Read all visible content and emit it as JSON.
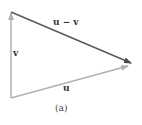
{
  "figure": {
    "caption": "(a)",
    "vectors": [
      {
        "name": "v",
        "label": "v",
        "from": [
          11,
          98
        ],
        "to": [
          11,
          12
        ],
        "color": "#b0b0b0"
      },
      {
        "name": "u",
        "label": "u",
        "from": [
          11,
          98
        ],
        "to": [
          128,
          66
        ],
        "color": "#b0b0b0"
      },
      {
        "name": "u-minus-v",
        "label": "u − v",
        "from": [
          11,
          12
        ],
        "to": [
          131,
          63
        ],
        "color": "#5a5a5a"
      }
    ]
  }
}
